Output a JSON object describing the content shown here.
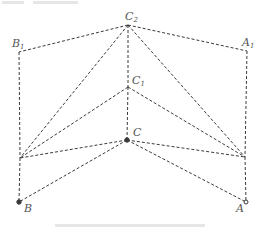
{
  "diagram": {
    "type": "geometry-unfolding",
    "style": {
      "line_color": "#3a3a3a",
      "label_color": "#555555",
      "line_style": "dashed"
    },
    "points": [
      {
        "id": "C2",
        "label": "C",
        "sub": "2",
        "x": 128,
        "y": 25,
        "lx": 125,
        "ly": 20
      },
      {
        "id": "B1",
        "label": "B",
        "sub": "1",
        "x": 19,
        "y": 52,
        "lx": 12,
        "ly": 47
      },
      {
        "id": "A1",
        "label": "A",
        "sub": "1",
        "x": 247,
        "y": 51,
        "lx": 242,
        "ly": 46
      },
      {
        "id": "C1",
        "label": "C",
        "sub": "1",
        "x": 128,
        "y": 87,
        "lx": 132,
        "ly": 84
      },
      {
        "id": "C",
        "label": "C",
        "sub": "",
        "x": 127,
        "y": 140,
        "lx": 133,
        "ly": 136
      },
      {
        "id": "M1",
        "label": "",
        "sub": "",
        "x": 20,
        "y": 158,
        "lx": 0,
        "ly": 0
      },
      {
        "id": "M2",
        "label": "",
        "sub": "",
        "x": 245,
        "y": 157,
        "lx": 0,
        "ly": 0
      },
      {
        "id": "B",
        "label": "B",
        "sub": "",
        "x": 19,
        "y": 202,
        "lx": 24,
        "ly": 212
      },
      {
        "id": "A",
        "label": "A",
        "sub": "",
        "x": 246,
        "y": 202,
        "lx": 236,
        "ly": 212
      }
    ],
    "edges": [
      [
        "C2",
        "B1"
      ],
      [
        "C2",
        "A1"
      ],
      [
        "C2",
        "C1"
      ],
      [
        "C2",
        "M1"
      ],
      [
        "C2",
        "M2"
      ],
      [
        "C1",
        "M1"
      ],
      [
        "C1",
        "M2"
      ],
      [
        "C1",
        "C"
      ],
      [
        "C",
        "M1"
      ],
      [
        "C",
        "M2"
      ],
      [
        "C",
        "B"
      ],
      [
        "C",
        "A"
      ],
      [
        "B1",
        "M1"
      ],
      [
        "M1",
        "B"
      ],
      [
        "A1",
        "M2"
      ],
      [
        "M2",
        "A"
      ]
    ],
    "markers": [
      {
        "at": "C",
        "kind": "filled-dot"
      },
      {
        "at": "B",
        "kind": "filled-dot"
      },
      {
        "at": "A",
        "kind": "open-dot"
      }
    ]
  }
}
